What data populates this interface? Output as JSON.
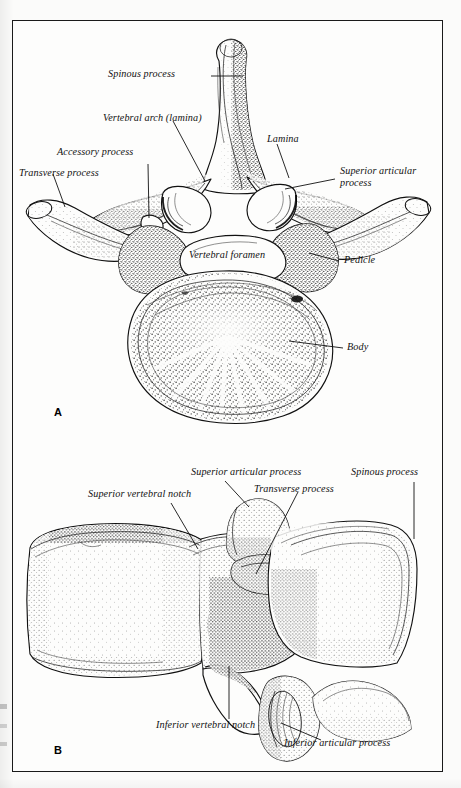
{
  "figure": {
    "panels": [
      {
        "id": "A",
        "letter": "A",
        "view": "superior view",
        "labels": [
          {
            "key": "spinous_process",
            "text": "Spinous process"
          },
          {
            "key": "vertebral_arch",
            "text": "Vertebral arch (lamina)"
          },
          {
            "key": "accessory_process",
            "text": "Accessory process"
          },
          {
            "key": "transverse_process",
            "text": "Transverse process"
          },
          {
            "key": "lamina",
            "text": "Lamina"
          },
          {
            "key": "superior_articular",
            "text": "Superior articular process"
          },
          {
            "key": "pedicle",
            "text": "Pedicle"
          },
          {
            "key": "vertebral_foramen",
            "text": "Vertebral foramen"
          },
          {
            "key": "body",
            "text": "Body"
          }
        ]
      },
      {
        "id": "B",
        "letter": "B",
        "view": "lateral view",
        "labels": [
          {
            "key": "superior_vertebral_notch",
            "text": "Superior vertebral notch"
          },
          {
            "key": "superior_articular",
            "text": "Superior articular process"
          },
          {
            "key": "transverse_process",
            "text": "Transverse process"
          },
          {
            "key": "spinous_process",
            "text": "Spinous process"
          },
          {
            "key": "inferior_vertebral_notch",
            "text": "Inferior vertebral notch"
          },
          {
            "key": "inferior_articular",
            "text": "Inferior articular process"
          }
        ]
      }
    ]
  },
  "colors": {
    "ink": "#111111",
    "page": "#fbfbfa",
    "frame": "#1a1a1a",
    "plate": "#fdfdfc"
  }
}
